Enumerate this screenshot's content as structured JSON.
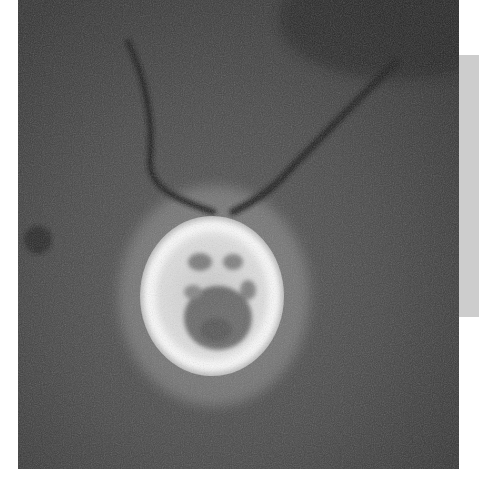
{
  "image": {
    "subject": "phase-contrast micrograph of a flagellated single-celled organism",
    "elements": [
      {
        "name": "cell-body",
        "description": "bright oval cell with dark granular interior"
      },
      {
        "name": "flagellum-left",
        "description": "long dark curved flagellum rising to upper left"
      },
      {
        "name": "flagellum-right",
        "description": "long dark straight flagellum rising to upper right"
      }
    ],
    "colors": {
      "background": "#454545",
      "halo": "#e8e8e8",
      "side_panel": "#cdcdcd"
    }
  }
}
